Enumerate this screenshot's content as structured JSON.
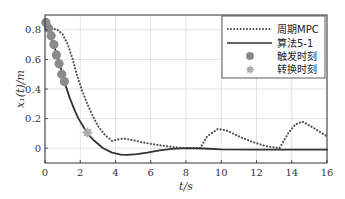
{
  "chart_data": {
    "type": "line",
    "title": "",
    "xlabel": "t/s",
    "ylabel": "x1(t)/m",
    "xlim": [
      0,
      16
    ],
    "ylim": [
      -0.1,
      0.9
    ],
    "grid": true,
    "legend_position": "upper right",
    "x_ticks": [
      0,
      2,
      4,
      6,
      8,
      10,
      12,
      14,
      16
    ],
    "x_tick_labels": [
      "0",
      "2",
      "4",
      "6",
      "8",
      "10",
      "12",
      "14",
      "16"
    ],
    "y_ticks": [
      0,
      0.2,
      0.4,
      0.6,
      0.8
    ],
    "y_tick_labels": [
      "0",
      "0.2",
      "0.4",
      "0.6",
      "0.8"
    ],
    "series": [
      {
        "name": "周期MPC",
        "style": "dotted",
        "color": "#555555",
        "x": [
          0,
          0.7,
          1.0,
          1.3,
          1.6,
          1.8,
          2.1,
          2.4,
          2.7,
          3.0,
          3.4,
          3.8,
          4.2,
          4.5,
          5.0,
          5.5,
          6.0,
          6.5,
          7.0,
          7.5,
          8.0,
          8.5,
          8.8,
          9.2,
          9.8,
          10.3,
          11.0,
          11.7,
          12.5,
          13.3,
          13.8,
          14.2,
          14.6,
          15.2,
          16.0
        ],
        "values": [
          0.82,
          0.8,
          0.77,
          0.7,
          0.59,
          0.5,
          0.39,
          0.3,
          0.22,
          0.15,
          0.09,
          0.05,
          0.06,
          0.065,
          0.055,
          0.04,
          0.03,
          0.02,
          0.012,
          0.005,
          0.0,
          0.0,
          0.0,
          0.08,
          0.13,
          0.12,
          0.08,
          0.045,
          0.015,
          0.0,
          0.1,
          0.16,
          0.18,
          0.14,
          0.08
        ]
      },
      {
        "name": "算法5-1",
        "style": "solid",
        "color": "#333333",
        "x": [
          0,
          0.3,
          0.6,
          0.9,
          1.1,
          1.4,
          1.7,
          1.9,
          2.2,
          2.4,
          2.8,
          3.3,
          3.8,
          4.3,
          4.7,
          5.2,
          5.8,
          6.5,
          7.2,
          8.0,
          9.0,
          10.0,
          12.0,
          14.0,
          16.0
        ],
        "values": [
          0.85,
          0.76,
          0.66,
          0.54,
          0.45,
          0.34,
          0.25,
          0.2,
          0.14,
          0.1,
          0.05,
          0.0,
          -0.03,
          -0.043,
          -0.045,
          -0.04,
          -0.03,
          -0.015,
          -0.005,
          0.0,
          -0.002,
          -0.008,
          -0.01,
          -0.01,
          -0.01
        ]
      }
    ],
    "markers": [
      {
        "name": "触发时刻",
        "shape": "circle",
        "color": "#8a8a8a",
        "points": [
          [
            0.05,
            0.85
          ],
          [
            0.2,
            0.81
          ],
          [
            0.35,
            0.76
          ],
          [
            0.5,
            0.7
          ],
          [
            0.65,
            0.63
          ],
          [
            0.8,
            0.57
          ],
          [
            0.95,
            0.5
          ],
          [
            1.1,
            0.45
          ]
        ]
      },
      {
        "name": "转换时刻",
        "shape": "star",
        "color": "#aaaaaa",
        "points": [
          [
            2.4,
            0.1
          ]
        ]
      }
    ]
  },
  "legend": {
    "items": [
      {
        "label": "周期MPC"
      },
      {
        "label": "算法5-1"
      },
      {
        "label": "触发时刻"
      },
      {
        "label": "转换时刻"
      }
    ]
  },
  "axes": {
    "xlabel": "t/s",
    "ylabel": "x₁(t)/m"
  }
}
